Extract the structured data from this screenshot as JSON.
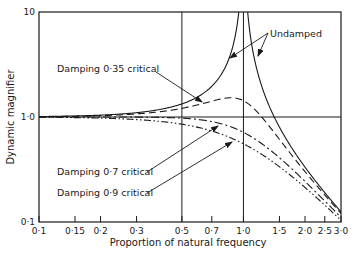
{
  "chart_data": {
    "type": "line",
    "title": "",
    "xlabel": "Proportion of natural frequency",
    "ylabel": "Dynamic magnifier",
    "xscale": "log",
    "yscale": "log",
    "xlim": [
      0.1,
      3.0
    ],
    "ylim": [
      0.1,
      10
    ],
    "grid": false,
    "x_ticks": [
      0.1,
      0.15,
      0.2,
      0.3,
      0.5,
      0.7,
      1.0,
      1.5,
      2.0,
      2.5,
      3.0
    ],
    "x_tick_labels": [
      "0·1",
      "0·15",
      "0·2",
      "0·3",
      "0·5",
      "0·7",
      "1·0",
      "1·5",
      "2·0",
      "2·5",
      "3·0"
    ],
    "y_ticks": [
      0.1,
      1.0,
      10
    ],
    "y_tick_labels": [
      "0·1",
      "1·0",
      "10"
    ],
    "reference_lines": {
      "vertical": [
        0.5,
        1.0
      ],
      "horizontal": [
        1.0
      ]
    },
    "series": [
      {
        "name": "Undamped",
        "damping_ratio": 0.0,
        "style": "solid",
        "x": [
          0.1,
          0.2,
          0.3,
          0.5,
          0.7,
          0.9,
          0.95,
          1.05,
          1.1,
          1.5,
          2.0,
          2.5,
          3.0
        ],
        "y": [
          1.01,
          1.04,
          1.1,
          1.33,
          1.96,
          5.26,
          10.3,
          9.8,
          4.76,
          0.8,
          0.33,
          0.19,
          0.125
        ]
      },
      {
        "name": "Damping 0·35 critical",
        "damping_ratio": 0.35,
        "style": "dashed",
        "x": [
          0.1,
          0.2,
          0.3,
          0.5,
          0.7,
          0.85,
          1.0,
          1.5,
          2.0,
          2.5,
          3.0
        ],
        "y": [
          1.01,
          1.03,
          1.07,
          1.18,
          1.37,
          1.47,
          1.43,
          0.67,
          0.31,
          0.18,
          0.12
        ]
      },
      {
        "name": "Damping 0·7 critical",
        "damping_ratio": 0.7,
        "style": "dash-dot",
        "x": [
          0.1,
          0.2,
          0.3,
          0.5,
          0.7,
          1.0,
          1.5,
          2.0,
          2.5,
          3.0
        ],
        "y": [
          1.0,
          1.0,
          0.99,
          0.97,
          0.88,
          0.71,
          0.45,
          0.28,
          0.18,
          0.12
        ]
      },
      {
        "name": "Damping 0·9 critical",
        "damping_ratio": 0.9,
        "style": "dash-dot-dot",
        "x": [
          0.1,
          0.2,
          0.3,
          0.5,
          0.7,
          1.0,
          1.5,
          2.0,
          2.5,
          3.0
        ],
        "y": [
          0.99,
          0.97,
          0.93,
          0.82,
          0.69,
          0.56,
          0.39,
          0.26,
          0.17,
          0.12
        ]
      }
    ],
    "annotations": [
      {
        "text": "Undamped",
        "points_to": [
          "Undamped (left branch)",
          "Undamped (right branch)"
        ]
      },
      {
        "text": "Damping 0·35 critical",
        "points_to": [
          "Damping 0·35 critical"
        ]
      },
      {
        "text": "Damping 0·7 critical",
        "points_to": [
          "Damping 0·7 critical"
        ]
      },
      {
        "text": "Damping 0·9 critical",
        "points_to": [
          "Damping 0·9 critical"
        ]
      }
    ],
    "legend": "none (inline annotations with arrows)"
  },
  "labels": {
    "ylabel": "Dynamic magnifier",
    "xlabel": "Proportion of natural frequency",
    "undamped": "Undamped",
    "d035": "Damping 0·35 critical",
    "d07": "Damping 0·7 critical",
    "d09": "Damping 0·9 critical"
  },
  "layout": {
    "plot_left": 39,
    "plot_right": 341,
    "plot_top": 12,
    "plot_bottom": 222,
    "line_color": "#1a1a1a"
  }
}
